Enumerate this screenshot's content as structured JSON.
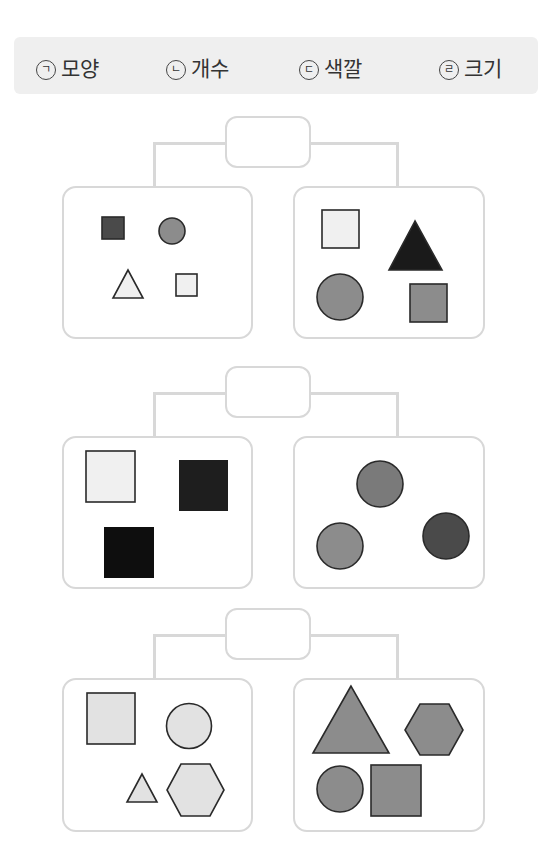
{
  "legend": {
    "items": [
      {
        "mark": "ㄱ",
        "label": "모양"
      },
      {
        "mark": "ㄴ",
        "label": "개수"
      },
      {
        "mark": "ㄷ",
        "label": "색깔"
      },
      {
        "mark": "ㄹ",
        "label": "크기"
      }
    ]
  },
  "colors": {
    "border": "#d8d8d8",
    "legend_bg": "#efefef",
    "white": "#f0f0f0",
    "light": "#e2e2e2",
    "mid": "#8c8c8c",
    "midgray": "#7a7a7a",
    "dark": "#4a4a4a",
    "black": "#1a1a1a"
  },
  "groups": [
    {
      "answer_box": "",
      "left": [
        "dark small square",
        "gray small circle",
        "white small triangle",
        "white small square"
      ],
      "right": [
        "white large square",
        "black large triangle",
        "gray large circle",
        "gray large square"
      ]
    },
    {
      "answer_box": "",
      "left": [
        "white square",
        "black square",
        "black square"
      ],
      "right": [
        "gray circle",
        "gray circle",
        "dark circle"
      ]
    },
    {
      "answer_box": "",
      "left": [
        "light square",
        "light circle",
        "light triangle",
        "light hexagon"
      ],
      "right": [
        "gray triangle",
        "gray hexagon",
        "gray circle",
        "gray square"
      ]
    }
  ]
}
